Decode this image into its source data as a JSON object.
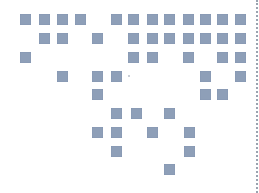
{
  "grid": {
    "square_size": 11,
    "color": "#8e9fb8",
    "squares": [
      [
        20,
        14
      ],
      [
        39,
        14
      ],
      [
        57,
        14
      ],
      [
        75,
        14
      ],
      [
        111,
        14
      ],
      [
        128,
        14
      ],
      [
        147,
        14
      ],
      [
        164,
        14
      ],
      [
        183,
        14
      ],
      [
        200,
        14
      ],
      [
        217,
        14
      ],
      [
        235,
        14
      ],
      [
        39,
        33
      ],
      [
        57,
        33
      ],
      [
        92,
        33
      ],
      [
        128,
        33
      ],
      [
        147,
        33
      ],
      [
        164,
        33
      ],
      [
        183,
        33
      ],
      [
        200,
        33
      ],
      [
        217,
        33
      ],
      [
        235,
        33
      ],
      [
        20,
        52
      ],
      [
        128,
        52
      ],
      [
        147,
        52
      ],
      [
        183,
        52
      ],
      [
        217,
        52
      ],
      [
        235,
        52
      ],
      [
        57,
        71
      ],
      [
        92,
        71
      ],
      [
        111,
        71
      ],
      [
        200,
        71
      ],
      [
        235,
        71
      ],
      [
        92,
        89
      ],
      [
        200,
        89
      ],
      [
        217,
        89
      ],
      [
        111,
        108
      ],
      [
        131,
        108
      ],
      [
        164,
        108
      ],
      [
        92,
        127
      ],
      [
        111,
        127
      ],
      [
        147,
        127
      ],
      [
        184,
        127
      ],
      [
        111,
        146
      ],
      [
        184,
        146
      ],
      [
        164,
        164
      ]
    ]
  },
  "marks": {
    "dot": [
      128,
      75
    ],
    "divider_x": 256,
    "divider_color": "#9aa3b0"
  }
}
